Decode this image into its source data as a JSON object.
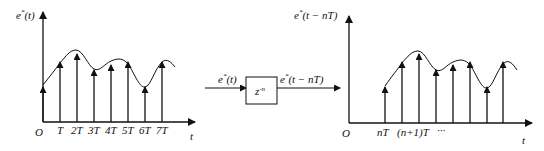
{
  "left_plot": {
    "y_label": "e*(t)",
    "y_label_base": "e",
    "y_label_sup": "*",
    "y_label_arg": "(t)",
    "origin_label": "O",
    "x_axis_label": "t",
    "tick_labels": [
      "T",
      "2T",
      "3T",
      "4T",
      "5T",
      "6T",
      "7T"
    ],
    "impulse_x": [
      43,
      60,
      77,
      94,
      111,
      128,
      145,
      162
    ],
    "impulse_top_y": [
      87,
      62,
      54,
      70,
      65,
      62,
      87,
      62
    ]
  },
  "block": {
    "transfer_function": "z^-n",
    "tf_base": "z",
    "tf_sup": "-n",
    "input_label": "e*(t)",
    "input_base": "e",
    "input_sup": "*",
    "input_arg": "(t)",
    "output_label": "e*(t-nT)",
    "output_base": "e",
    "output_sup": "*",
    "output_arg": "(t − nT)"
  },
  "right_plot": {
    "y_label": "e*(t-nT)",
    "y_label_base": "e",
    "y_label_sup": "*",
    "y_label_arg": "(t − nT)",
    "origin_label": "O",
    "x_axis_label": "t",
    "tick_labels": [
      "nT",
      "(n+1)T",
      "···"
    ],
    "impulse_x": [
      385,
      402,
      419,
      436,
      453,
      470,
      487,
      503
    ],
    "impulse_top_y": [
      87,
      62,
      54,
      70,
      65,
      62,
      87,
      62
    ]
  },
  "colors": {
    "stroke": "#111111",
    "background": "#ffffff"
  }
}
